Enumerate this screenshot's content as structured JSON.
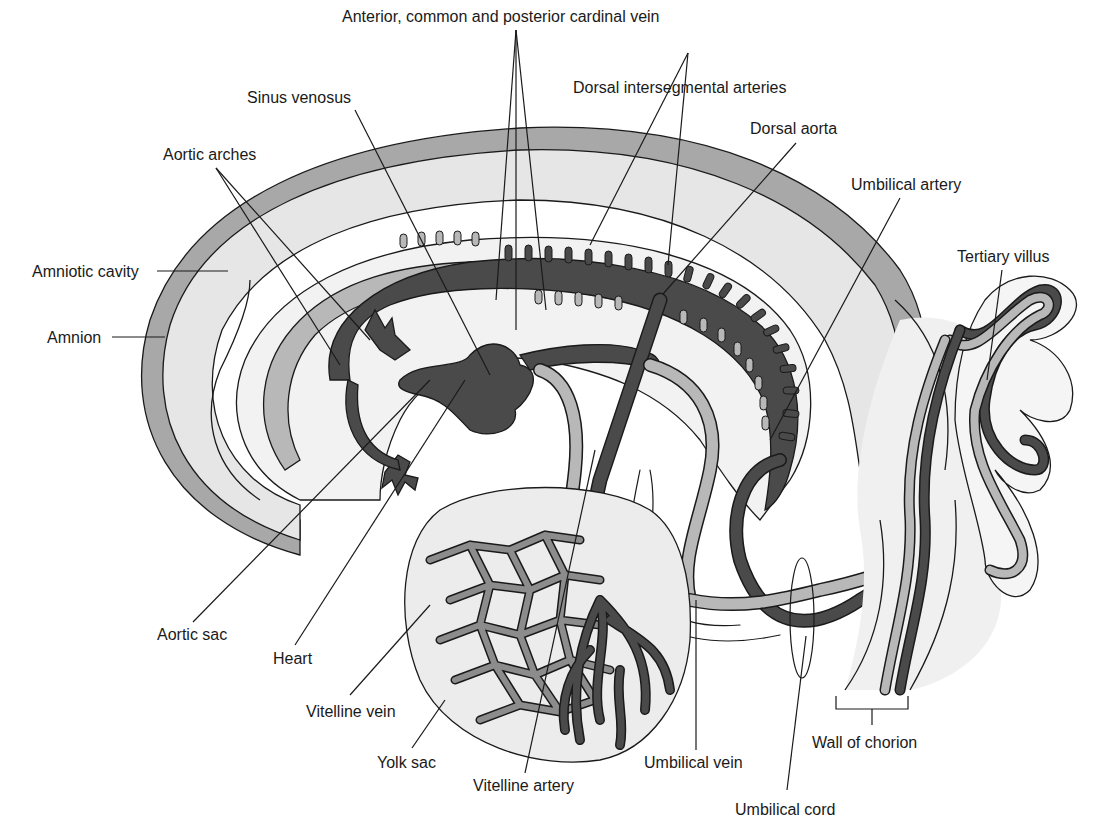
{
  "diagram": {
    "colors": {
      "background": "#ffffff",
      "amnion_band": "#a8a8a8",
      "amniotic_fill": "#e6e6e6",
      "light_tissue": "#f0f0f0",
      "vessel_dark": "#4a4a4a",
      "vessel_medium": "#8c8c8c",
      "vessel_light": "#b8b8b8",
      "outline": "#1a1a1a"
    },
    "labels": {
      "cardinal_vein": "Anterior, common and posterior cardinal vein",
      "sinus_venosus": "Sinus venosus",
      "dorsal_intersegmental": "Dorsal intersegmental arteries",
      "dorsal_aorta": "Dorsal aorta",
      "aortic_arches": "Aortic arches",
      "umbilical_artery": "Umbilical artery",
      "tertiary_villus": "Tertiary villus",
      "amniotic_cavity": "Amniotic cavity",
      "amnion": "Amnion",
      "aortic_sac": "Aortic sac",
      "heart": "Heart",
      "vitelline_vein": "Vitelline vein",
      "yolk_sac": "Yolk sac",
      "vitelline_artery": "Vitelline artery",
      "umbilical_vein": "Umbilical vein",
      "wall_of_chorion": "Wall of chorion",
      "umbilical_cord": "Umbilical cord"
    }
  }
}
